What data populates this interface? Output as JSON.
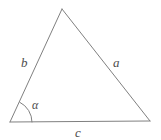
{
  "figure": {
    "type": "geometry-diagram",
    "shape": "triangle",
    "background_color": "#ffffff",
    "stroke_color": "#808080",
    "text_color": "#4d4d4d",
    "stroke_width": 1,
    "width": 161,
    "height": 140,
    "vertices": {
      "apex": {
        "x": 62,
        "y": 9
      },
      "bottom_left": {
        "x": 10,
        "y": 122
      },
      "bottom_right": {
        "x": 150,
        "y": 121
      }
    },
    "sides": [
      {
        "id": "side-b",
        "label": "b",
        "from": "bottom_left",
        "to": "apex",
        "label_position": {
          "x": 21,
          "y": 56
        }
      },
      {
        "id": "side-a",
        "label": "a",
        "from": "apex",
        "to": "bottom_right",
        "label_position": {
          "x": 113,
          "y": 56
        }
      },
      {
        "id": "side-c",
        "label": "c",
        "from": "bottom_left",
        "to": "bottom_right",
        "label_position": {
          "x": 75,
          "y": 126
        }
      }
    ],
    "angles": [
      {
        "id": "angle-alpha",
        "label": "α",
        "at_vertex": "bottom_left",
        "arc_radius": 22,
        "label_position": {
          "x": 32,
          "y": 99
        }
      }
    ]
  }
}
